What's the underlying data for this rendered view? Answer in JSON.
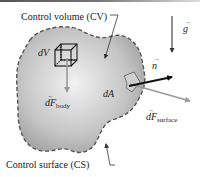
{
  "labels": {
    "control_volume": "Control volume (CV)",
    "control_surface": "Control surface (CS)",
    "dV": "dV",
    "dA": "dA",
    "n": "n",
    "g": "g",
    "dF_body_base": "dF",
    "dF_body_sub": "body",
    "dF_surface_base": "dF",
    "dF_surface_sub": "surface"
  },
  "colors": {
    "region_fill_center": "#f2f2f2",
    "region_fill_edge": "#a8a8a8",
    "boundary": "#555555",
    "normal_arrow": "#111111",
    "force_arrow": "#9a9a9a",
    "text": "#222222"
  }
}
